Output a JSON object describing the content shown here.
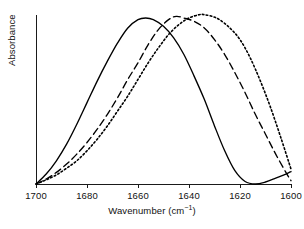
{
  "chart_data": {
    "type": "line",
    "title": "",
    "xlabel": "Wavenumber (cm⁻¹)",
    "xlabel_base": "Wavenumber (cm",
    "xlabel_sup": "−1",
    "xlabel_tail": ")",
    "ylabel": "Absorbance",
    "xlim": [
      1700,
      1600
    ],
    "x_axis_reversed": true,
    "ylim": [
      0,
      1
    ],
    "grid": false,
    "legend": "none",
    "y_ticks": [],
    "y_tick_labels": [],
    "x_ticks": [
      1700,
      1680,
      1660,
      1640,
      1620,
      1600
    ],
    "x_tick_labels": [
      "1700",
      "1680",
      "1660",
      "1640",
      "1620",
      "1600"
    ],
    "series": [
      {
        "name": "solid",
        "style": "solid",
        "color": "#000000",
        "peak_x": 1657,
        "peak_y": 1.0,
        "x": [
          1700,
          1696,
          1692,
          1688,
          1684,
          1680,
          1676,
          1672,
          1668,
          1664,
          1660,
          1657,
          1654,
          1650,
          1646,
          1642,
          1638,
          1634,
          1630,
          1626,
          1622,
          1618,
          1614,
          1610,
          1606,
          1602,
          1600
        ],
        "y": [
          0.0,
          0.06,
          0.14,
          0.24,
          0.36,
          0.49,
          0.62,
          0.74,
          0.85,
          0.94,
          0.99,
          1.0,
          0.99,
          0.95,
          0.88,
          0.78,
          0.65,
          0.51,
          0.35,
          0.2,
          0.08,
          0.015,
          0.0,
          0.012,
          0.035,
          0.06,
          0.075
        ]
      },
      {
        "name": "dashed",
        "style": "dashed",
        "color": "#000000",
        "peak_x": 1645,
        "peak_y": 1.01,
        "x": [
          1700,
          1696,
          1692,
          1688,
          1684,
          1680,
          1676,
          1672,
          1668,
          1664,
          1660,
          1656,
          1652,
          1648,
          1645,
          1642,
          1638,
          1634,
          1630,
          1626,
          1622,
          1618,
          1614,
          1610,
          1606,
          1602,
          1600
        ],
        "y": [
          0.0,
          0.03,
          0.07,
          0.12,
          0.18,
          0.25,
          0.33,
          0.42,
          0.52,
          0.63,
          0.73,
          0.84,
          0.93,
          0.99,
          1.01,
          1.0,
          0.98,
          0.94,
          0.87,
          0.78,
          0.67,
          0.55,
          0.42,
          0.3,
          0.18,
          0.07,
          0.02
        ]
      },
      {
        "name": "dotted",
        "style": "dotted",
        "color": "#000000",
        "peak_x": 1634,
        "peak_y": 1.02,
        "x": [
          1700,
          1696,
          1692,
          1688,
          1684,
          1680,
          1676,
          1672,
          1668,
          1664,
          1660,
          1656,
          1652,
          1648,
          1644,
          1640,
          1636,
          1634,
          1631,
          1628,
          1624,
          1620,
          1616,
          1612,
          1608,
          1604,
          1600
        ],
        "y": [
          0.0,
          0.025,
          0.055,
          0.095,
          0.14,
          0.2,
          0.27,
          0.35,
          0.44,
          0.53,
          0.63,
          0.73,
          0.82,
          0.9,
          0.96,
          1.0,
          1.02,
          1.02,
          1.01,
          0.99,
          0.94,
          0.87,
          0.76,
          0.62,
          0.46,
          0.28,
          0.09
        ]
      }
    ]
  }
}
